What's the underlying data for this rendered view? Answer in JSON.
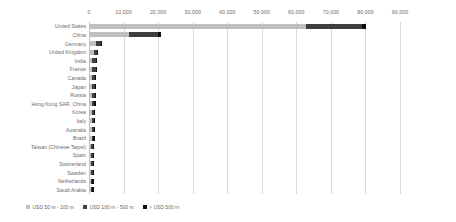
{
  "chart_data": {
    "type": "bar",
    "orientation": "horizontal",
    "stacked": true,
    "title": "",
    "xlabel": "",
    "ylabel": "",
    "xlim": [
      0,
      90000
    ],
    "grid": true,
    "legend_position": "bottom-left",
    "xticks": [
      "0",
      "10,000",
      "20,000",
      "30,000",
      "40,000",
      "50,000",
      "60,000",
      "70,000",
      "80,000",
      "90,000"
    ],
    "xtick_values": [
      0,
      10000,
      20000,
      30000,
      40000,
      50000,
      60000,
      70000,
      80000,
      90000
    ],
    "categories": [
      "United States",
      "China",
      "Germany",
      "United Kingdom",
      "India",
      "France",
      "Canada",
      "Japan",
      "Russia",
      "Hong Kong SAR, China",
      "Korea",
      "Italy",
      "Australia",
      "Brazil",
      "Taiwan (Chinese Taipei)",
      "Spain",
      "Switzerland",
      "Sweden",
      "Netherlands",
      "Saudi Arabia"
    ],
    "series": [
      {
        "name": "USD 50 m - 100 m",
        "color": "#bfbfbf",
        "values": [
          62500,
          11300,
          1700,
          1050,
          700,
          720,
          690,
          660,
          600,
          560,
          520,
          500,
          470,
          440,
          400,
          360,
          330,
          300,
          250,
          200
        ]
      },
      {
        "name": "USD 100 m - 500 m",
        "color": "#3f3f3f",
        "values": [
          16200,
          8300,
          1500,
          900,
          1050,
          880,
          840,
          800,
          760,
          700,
          660,
          620,
          580,
          540,
          500,
          460,
          420,
          380,
          300,
          240
        ]
      },
      {
        "name": "> USD 500 m",
        "color": "#0d0d0d",
        "values": [
          1300,
          900,
          120,
          80,
          70,
          60,
          60,
          55,
          50,
          45,
          45,
          40,
          38,
          35,
          32,
          28,
          25,
          22,
          18,
          15
        ]
      }
    ],
    "totals": [
      80000,
      20500,
      3320,
      2030,
      1820,
      1660,
      1590,
      1515,
      1410,
      1305,
      1225,
      1160,
      1088,
      1015,
      932,
      848,
      775,
      702,
      568,
      455
    ]
  },
  "legend": {
    "items": [
      {
        "label": "USD 50 m - 100 m",
        "swatch": "legend-swatch-light"
      },
      {
        "label": "USD 100 m - 500 m",
        "swatch": "legend-swatch-dark"
      },
      {
        "label": "> USD 500 m",
        "swatch": "legend-swatch-black"
      }
    ]
  }
}
